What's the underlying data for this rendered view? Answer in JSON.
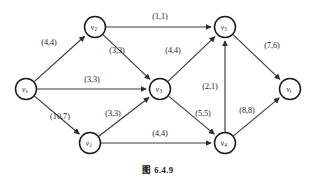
{
  "figure": {
    "caption": "图 6.4.9",
    "kind": "network-flow-diagram",
    "colors": {
      "background": "#ffffff",
      "edge": "#3a3a3a",
      "node_stroke": "#1a1a1a",
      "text": "#1a1a1a"
    }
  },
  "nodes": [
    {
      "id": "vs",
      "label": "v",
      "sub": "s",
      "x": 26,
      "y": 89
    },
    {
      "id": "v2",
      "label": "v",
      "sub": "2",
      "x": 95,
      "y": 27
    },
    {
      "id": "v3",
      "label": "v",
      "sub": "3",
      "x": 160,
      "y": 89
    },
    {
      "id": "v1",
      "label": "v",
      "sub": "1",
      "x": 90,
      "y": 143
    },
    {
      "id": "v5",
      "label": "v",
      "sub": "5",
      "x": 225,
      "y": 27
    },
    {
      "id": "v4",
      "label": "v",
      "sub": "4",
      "x": 225,
      "y": 143
    },
    {
      "id": "vt",
      "label": "v",
      "sub": "t",
      "x": 290,
      "y": 89
    }
  ],
  "edges": [
    {
      "id": "vs-v2",
      "from": "vs",
      "to": "v2",
      "capacity": 4,
      "flow": 4,
      "label": "(4,4)",
      "lx": 49,
      "ly": 42
    },
    {
      "id": "vs-v3",
      "from": "vs",
      "to": "v3",
      "capacity": 3,
      "flow": 3,
      "label": "(3,3)",
      "lx": 92,
      "ly": 79
    },
    {
      "id": "vs-v1",
      "from": "vs",
      "to": "v1",
      "capacity": 10,
      "flow": 7,
      "label": "(10,7)",
      "lx": 60,
      "ly": 116
    },
    {
      "id": "v2-v5",
      "from": "v2",
      "to": "v5",
      "capacity": 1,
      "flow": 1,
      "label": "(1,1)",
      "lx": 160,
      "ly": 16
    },
    {
      "id": "v2-v3",
      "from": "v2",
      "to": "v3",
      "capacity": 3,
      "flow": 3,
      "label": "(3,3)",
      "lx": 117,
      "ly": 50
    },
    {
      "id": "v1-v3",
      "from": "v1",
      "to": "v3",
      "capacity": 3,
      "flow": 3,
      "label": "(3,3)",
      "lx": 113,
      "ly": 113
    },
    {
      "id": "v1-v4",
      "from": "v1",
      "to": "v4",
      "capacity": 4,
      "flow": 4,
      "label": "(4,4)",
      "lx": 160,
      "ly": 133
    },
    {
      "id": "v3-v5",
      "from": "v3",
      "to": "v5",
      "capacity": 4,
      "flow": 4,
      "label": "(4,4)",
      "lx": 173,
      "ly": 50
    },
    {
      "id": "v3-v4",
      "from": "v3",
      "to": "v4",
      "capacity": 5,
      "flow": 5,
      "label": "(5,5)",
      "lx": 203,
      "ly": 113
    },
    {
      "id": "v4-v5",
      "from": "v4",
      "to": "v5",
      "capacity": 2,
      "flow": 1,
      "label": "(2,1)",
      "lx": 210,
      "ly": 86
    },
    {
      "id": "v4-vt",
      "from": "v4",
      "to": "vt",
      "capacity": 8,
      "flow": 8,
      "label": "(8,8)",
      "lx": 247,
      "ly": 110
    },
    {
      "id": "v5-vt",
      "from": "v5",
      "to": "vt",
      "capacity": 7,
      "flow": 6,
      "label": "(7,6)",
      "lx": 272,
      "ly": 45
    }
  ],
  "caption_pos": {
    "x": 158,
    "y": 170
  }
}
